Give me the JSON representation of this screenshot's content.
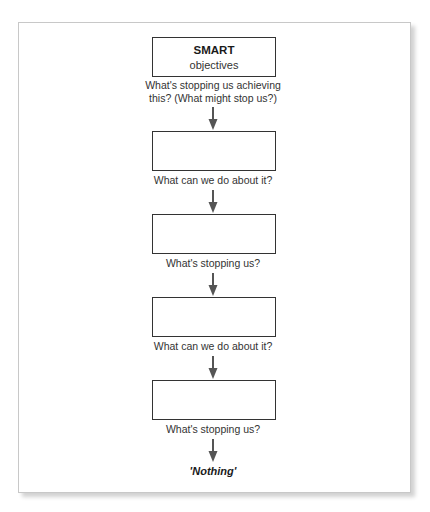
{
  "diagram": {
    "type": "vertical-flowchart",
    "start_box": {
      "title": "SMART",
      "subtitle": "objectives"
    },
    "steps": [
      {
        "label_line1": "What's stopping us achieving",
        "label_line2": "this? (What might stop us?)"
      },
      {
        "label": "What can we do about it?"
      },
      {
        "label": "What's stopping us?"
      },
      {
        "label": "What can we do about it?"
      },
      {
        "label": "What's stopping us?"
      }
    ],
    "end_text": "'Nothing'",
    "colors": {
      "box_border": "#333333",
      "arrow": "#555555",
      "text": "#333333",
      "frame_border": "#c8c8c8"
    }
  }
}
